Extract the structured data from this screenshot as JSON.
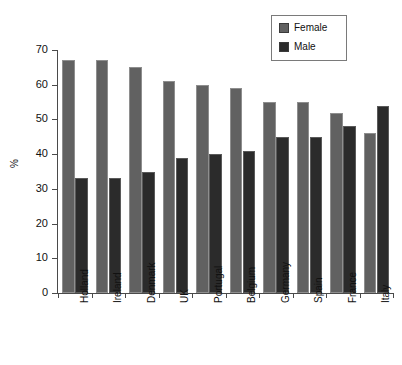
{
  "chart_data": {
    "type": "bar",
    "title": "",
    "subtitle": "",
    "xlabel": "",
    "ylabel": "%",
    "ylim": [
      0,
      70
    ],
    "ytick_values": [
      0,
      10,
      20,
      30,
      40,
      50,
      60,
      70
    ],
    "ytick_labels": [
      "0",
      "10",
      "20",
      "30",
      "40",
      "50",
      "60",
      "70"
    ],
    "grid": false,
    "legend_position": "top-right",
    "categories": [
      "Holland",
      "Ireland",
      "Denmark",
      "UK",
      "Portugal",
      "Belgium",
      "Germany",
      "Spain",
      "France",
      "Italy"
    ],
    "series": [
      {
        "name": "Female",
        "color": "#616161",
        "values": [
          67,
          67,
          65,
          61,
          60,
          59,
          55,
          55,
          52,
          46
        ]
      },
      {
        "name": "Male",
        "color": "#2b2b2b",
        "values": [
          33,
          33,
          35,
          39,
          40,
          41,
          45,
          45,
          48,
          54
        ]
      }
    ]
  },
  "legend": {
    "entries": [
      {
        "label": "Female",
        "color": "#616161"
      },
      {
        "label": "Male",
        "color": "#2b2b2b"
      }
    ]
  },
  "colors": {
    "female": "#616161",
    "male": "#2b2b2b",
    "axis": "#4a4a4a",
    "text": "#111111",
    "background": "#ffffff"
  }
}
